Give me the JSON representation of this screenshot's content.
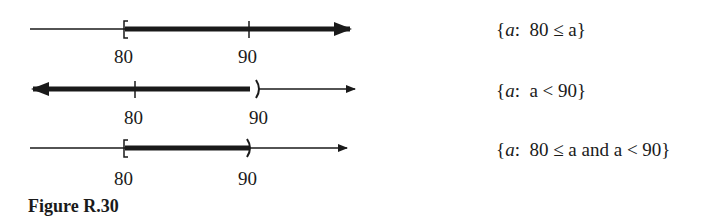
{
  "figure": {
    "caption": "Figure R.30",
    "rows": [
      {
        "tick_labels": [
          "80",
          "90"
        ],
        "set_open": "{",
        "set_var": "a",
        "set_colon": ":",
        "set_body": "80 ≤ a",
        "set_close": "}",
        "interval": "[80, ∞)",
        "left_endpoint": "[",
        "right_endpoint": "arrow"
      },
      {
        "tick_labels": [
          "80",
          "90"
        ],
        "set_open": "{",
        "set_var": "a",
        "set_colon": ":",
        "set_body": "a < 90",
        "set_close": "}",
        "interval": "(-∞, 90)",
        "left_endpoint": "arrow",
        "right_endpoint": ")"
      },
      {
        "tick_labels": [
          "80",
          "90"
        ],
        "set_open": "{",
        "set_var": "a",
        "set_colon": ":",
        "set_body": "80 ≤ a and a < 90",
        "set_close": "}",
        "interval": "[80, 90)",
        "left_endpoint": "[",
        "right_endpoint": ")"
      }
    ]
  },
  "colors": {
    "ink": "#1a1a1a",
    "background": "#ffffff"
  }
}
